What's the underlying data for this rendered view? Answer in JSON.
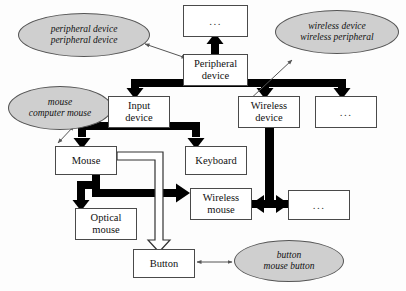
{
  "diagram": {
    "colors": {
      "ellipse_fill": "#cfcfcf",
      "ellipse_stroke": "#555555",
      "box_fill": "#ffffff",
      "box_stroke": "#4a4a4a",
      "thick_arrow": "#000000",
      "thin_arrow": "#555555",
      "hollow_arrow_fill": "#ffffff",
      "hollow_arrow_stroke": "#333333",
      "background": "#fdfdfd"
    },
    "nodes": [
      {
        "id": "ellipse-peripheral",
        "shape": "ellipse",
        "lines": [
          "peripheral device",
          "peripheral device"
        ],
        "x": 18,
        "y": 13,
        "w": 132,
        "h": 44
      },
      {
        "id": "ellipse-wireless",
        "shape": "ellipse",
        "lines": [
          "wireless device",
          "wireless peripheral"
        ],
        "x": 275,
        "y": 10,
        "w": 124,
        "h": 44
      },
      {
        "id": "ellipse-mouse",
        "shape": "ellipse",
        "lines": [
          "mouse",
          "computer mouse"
        ],
        "x": 8,
        "y": 86,
        "w": 104,
        "h": 44
      },
      {
        "id": "ellipse-button",
        "shape": "ellipse",
        "lines": [
          "button",
          "mouse button"
        ],
        "x": 234,
        "y": 240,
        "w": 110,
        "h": 42
      },
      {
        "id": "box-top-dots",
        "shape": "box",
        "lines": [
          "..."
        ],
        "x": 183,
        "y": 5,
        "w": 65,
        "h": 32,
        "dots": true
      },
      {
        "id": "box-peripheral-device",
        "shape": "box",
        "lines": [
          "Peripheral",
          "device"
        ],
        "x": 183,
        "y": 54,
        "w": 65,
        "h": 32
      },
      {
        "id": "box-input-device",
        "shape": "box",
        "lines": [
          "Input",
          "device"
        ],
        "x": 108,
        "y": 96,
        "w": 62,
        "h": 32
      },
      {
        "id": "box-wireless-device",
        "shape": "box",
        "lines": [
          "Wireless",
          "device"
        ],
        "x": 238,
        "y": 96,
        "w": 62,
        "h": 32
      },
      {
        "id": "box-right-dots-1",
        "shape": "box",
        "lines": [
          "..."
        ],
        "x": 315,
        "y": 96,
        "w": 62,
        "h": 32,
        "dots": true
      },
      {
        "id": "box-mouse",
        "shape": "box",
        "lines": [
          "Mouse"
        ],
        "x": 55,
        "y": 146,
        "w": 62,
        "h": 29
      },
      {
        "id": "box-keyboard",
        "shape": "box",
        "lines": [
          "Keyboard"
        ],
        "x": 185,
        "y": 146,
        "w": 62,
        "h": 29
      },
      {
        "id": "box-wireless-mouse",
        "shape": "box",
        "lines": [
          "Wireless",
          "mouse"
        ],
        "x": 190,
        "y": 188,
        "w": 62,
        "h": 32
      },
      {
        "id": "box-right-dots-2",
        "shape": "box",
        "lines": [
          "..."
        ],
        "x": 288,
        "y": 190,
        "w": 62,
        "h": 30,
        "dots": true
      },
      {
        "id": "box-optical-mouse",
        "shape": "box",
        "lines": [
          "Optical",
          "mouse"
        ],
        "x": 75,
        "y": 208,
        "w": 62,
        "h": 32
      },
      {
        "id": "box-button",
        "shape": "box",
        "lines": [
          "Button"
        ],
        "x": 133,
        "y": 249,
        "w": 62,
        "h": 29
      }
    ],
    "edges": [
      {
        "id": "edge-peripheral-up-to-dots",
        "kind": "thick",
        "from": "box-peripheral-device",
        "to": "box-top-dots"
      },
      {
        "id": "edge-peripheral-to-input",
        "kind": "thick",
        "from": "box-peripheral-device",
        "to": "box-input-device"
      },
      {
        "id": "edge-peripheral-to-wireless",
        "kind": "thick",
        "from": "box-peripheral-device",
        "to": "box-wireless-device"
      },
      {
        "id": "edge-peripheral-to-dots1",
        "kind": "thick",
        "from": "box-peripheral-device",
        "to": "box-right-dots-1"
      },
      {
        "id": "edge-input-to-mouse",
        "kind": "thick",
        "from": "box-input-device",
        "to": "box-mouse"
      },
      {
        "id": "edge-input-to-keyboard",
        "kind": "thick",
        "from": "box-input-device",
        "to": "box-keyboard"
      },
      {
        "id": "edge-mouse-to-optical",
        "kind": "thick",
        "from": "box-mouse",
        "to": "box-optical-mouse"
      },
      {
        "id": "edge-mouse-to-wireless-mouse",
        "kind": "thick",
        "from": "box-mouse",
        "to": "box-wireless-mouse"
      },
      {
        "id": "edge-wireless-device-to-wireless-mouse",
        "kind": "thick-double",
        "from": "box-wireless-device",
        "to": "box-wireless-mouse"
      },
      {
        "id": "edge-wireless-device-to-dots2",
        "kind": "thick-double",
        "from": "box-wireless-device",
        "to": "box-right-dots-2"
      },
      {
        "id": "edge-mouse-to-button",
        "kind": "hollow",
        "from": "box-mouse",
        "to": "box-button"
      },
      {
        "id": "edge-ellipse-peripheral-link",
        "kind": "thin-double",
        "from": "ellipse-peripheral",
        "to": "box-peripheral-device"
      },
      {
        "id": "edge-ellipse-wireless-link",
        "kind": "thin-double",
        "from": "ellipse-wireless",
        "to": "box-wireless-device"
      },
      {
        "id": "edge-ellipse-mouse-link",
        "kind": "thin-double",
        "from": "ellipse-mouse",
        "to": "box-mouse"
      },
      {
        "id": "edge-button-to-ellipse-button",
        "kind": "thin-double",
        "from": "box-button",
        "to": "ellipse-button"
      }
    ]
  }
}
